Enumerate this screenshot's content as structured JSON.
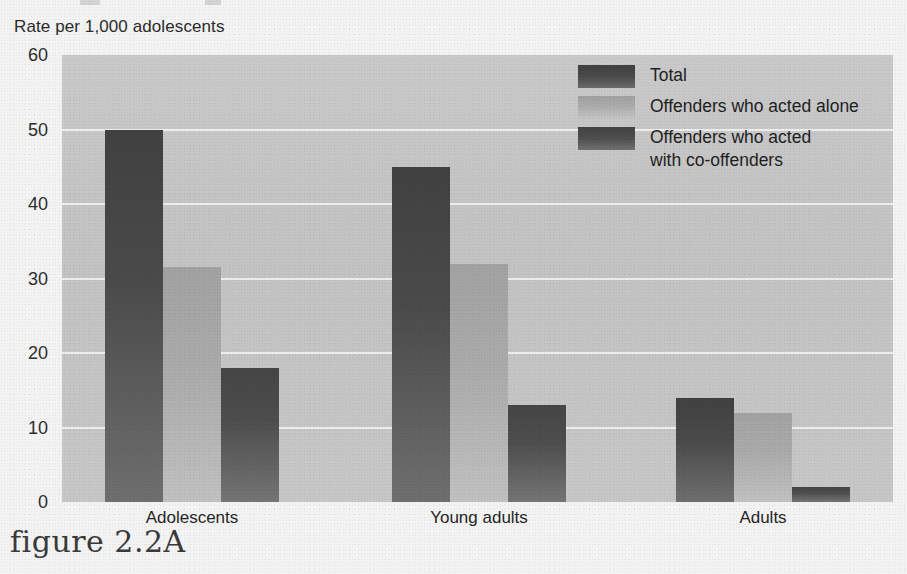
{
  "figure": {
    "caption": "figure 2.2A",
    "y_axis_title": "Rate per 1,000 adolescents"
  },
  "legend": {
    "items": [
      {
        "label": "Total",
        "key": "total"
      },
      {
        "label": "Offenders who acted alone",
        "key": "alone"
      },
      {
        "label": "Offenders who acted\nwith co-offenders",
        "key": "co"
      }
    ]
  },
  "axis": {
    "y_ticks": [
      "0",
      "10",
      "20",
      "30",
      "40",
      "50",
      "60"
    ],
    "x_categories": [
      "Adolescents",
      "Young adults",
      "Adults"
    ]
  },
  "colors": {
    "total": "#4a4a4a",
    "alone": "#ababab",
    "co": "#4e4e4e",
    "plot_background": "#c5c5c5",
    "gridline": "#f2f2f2",
    "page_background": "#f3f3f3",
    "text": "#2b2b2b"
  },
  "chart_data": {
    "type": "bar",
    "title": "",
    "xlabel": "",
    "ylabel": "Rate per 1,000 adolescents",
    "ylim": [
      0,
      60
    ],
    "ytick_step": 10,
    "grid": true,
    "legend_position": "top-right",
    "categories": [
      "Adolescents",
      "Young adults",
      "Adults"
    ],
    "series": [
      {
        "name": "Total",
        "values": [
          50,
          45,
          14
        ]
      },
      {
        "name": "Offenders who acted alone",
        "values": [
          31.5,
          32,
          12
        ]
      },
      {
        "name": "Offenders who acted with co-offenders",
        "values": [
          18,
          13,
          2
        ]
      }
    ]
  }
}
